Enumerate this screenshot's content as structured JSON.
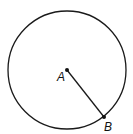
{
  "diagram": {
    "type": "circle-with-radius",
    "circle": {
      "cx": 67,
      "cy": 70,
      "r": 59,
      "stroke": "#1a1a1a"
    },
    "points": [
      {
        "label": "A",
        "x": 67,
        "y": 70,
        "role": "center"
      },
      {
        "label": "B",
        "x": 104,
        "y": 117,
        "role": "point-on-circle"
      }
    ],
    "segments": [
      {
        "from": "A",
        "to": "B"
      }
    ]
  }
}
